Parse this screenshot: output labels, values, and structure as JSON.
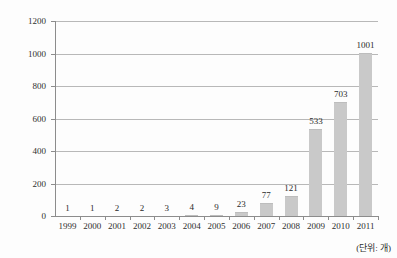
{
  "chart_data": {
    "type": "bar",
    "title": "",
    "xlabel": "",
    "ylabel": "",
    "categories": [
      "1999",
      "2000",
      "2001",
      "2002",
      "2003",
      "2004",
      "2005",
      "2006",
      "2007",
      "2008",
      "2009",
      "2010",
      "2011"
    ],
    "values": [
      1,
      1,
      2,
      2,
      3,
      4,
      9,
      23,
      77,
      121,
      533,
      703,
      1001
    ],
    "ylim": [
      0,
      1200
    ],
    "yticks": [
      0,
      200,
      400,
      600,
      800,
      1000,
      1200
    ],
    "grid": true,
    "legend": "none",
    "data_labels": true,
    "unit_label": "(단위: 개)",
    "colors": {
      "bar": "#c9c9c9",
      "bar_edge": "#bdbdbd",
      "gridline": "#b8b8b8",
      "axis": "#8c8c8c",
      "text": "#2f2f2f",
      "background": "#fdfdfd"
    }
  }
}
